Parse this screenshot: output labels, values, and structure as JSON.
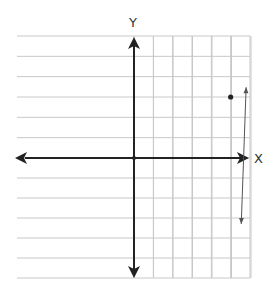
{
  "chart_data": {
    "type": "line",
    "title": "",
    "xlabel": "X",
    "ylabel": "Y",
    "xlim": [
      -6,
      6
    ],
    "ylim": [
      -6,
      6
    ],
    "grid": true,
    "tick_labels_shown": false,
    "series": [
      {
        "name": "line",
        "equation": "y = 3/5 x",
        "slope": 0.6,
        "intercept": 0,
        "x": [
          -5.5,
          5.8
        ],
        "y": [
          -3.3,
          3.48
        ],
        "arrows_both_ends": true
      }
    ],
    "points": [
      {
        "name": "origin",
        "x": 0,
        "y": 0
      },
      {
        "name": "marked-point",
        "x": 5,
        "y": 3
      }
    ],
    "colors": {
      "grid": "#c8c8c8",
      "axis": "#222222",
      "line": "#555555",
      "point": "#222222"
    }
  }
}
